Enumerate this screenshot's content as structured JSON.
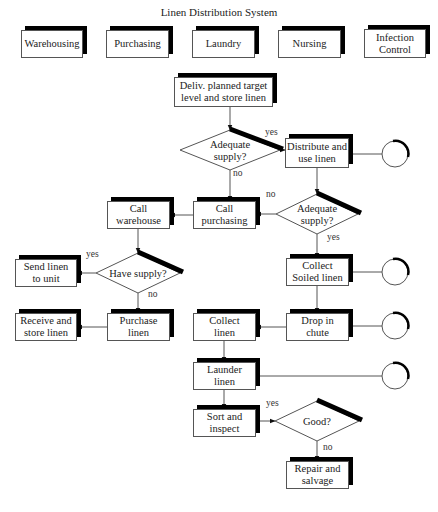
{
  "title": "Linen Distribution System",
  "colors": {
    "stroke": "#555555",
    "shadow": "#000000",
    "text": "#222222"
  },
  "departments": [
    {
      "id": "warehousing",
      "label": "Warehousing",
      "x": 21,
      "y": 30,
      "w": 62,
      "h": 28
    },
    {
      "id": "purchasing",
      "label": "Purchasing",
      "x": 106,
      "y": 30,
      "w": 63,
      "h": 28
    },
    {
      "id": "laundry",
      "label": "Laundry",
      "x": 192,
      "y": 30,
      "w": 63,
      "h": 28
    },
    {
      "id": "nursing",
      "label": "Nursing",
      "x": 278,
      "y": 30,
      "w": 63,
      "h": 28
    },
    {
      "id": "infection-control",
      "label": "Infection\nControl",
      "x": 364,
      "y": 29,
      "w": 62,
      "h": 29
    }
  ],
  "process_boxes": [
    {
      "id": "deliv-target",
      "label": "Deliv. planned target\nlevel and store linen",
      "x": 174,
      "y": 77,
      "w": 99,
      "h": 30
    },
    {
      "id": "distribute-use",
      "label": "Distribute and\nuse linen",
      "x": 285,
      "y": 138,
      "w": 64,
      "h": 30
    },
    {
      "id": "call-purchasing",
      "label": "Call\npurchasing",
      "x": 193,
      "y": 201,
      "w": 63,
      "h": 28
    },
    {
      "id": "call-warehouse",
      "label": "Call\nwarehouse",
      "x": 107,
      "y": 201,
      "w": 63,
      "h": 28
    },
    {
      "id": "send-linen",
      "label": "Send linen\nto unit",
      "x": 15,
      "y": 259,
      "w": 62,
      "h": 28
    },
    {
      "id": "collect-soiled",
      "label": "Collect\nSoiled linen",
      "x": 286,
      "y": 258,
      "w": 63,
      "h": 28
    },
    {
      "id": "receive-store",
      "label": "Receive and\nstore linen",
      "x": 15,
      "y": 313,
      "w": 62,
      "h": 28
    },
    {
      "id": "purchase-linen",
      "label": "Purchase\nlinen",
      "x": 107,
      "y": 313,
      "w": 63,
      "h": 28
    },
    {
      "id": "collect-linen",
      "label": "Collect\nlinen",
      "x": 193,
      "y": 313,
      "w": 63,
      "h": 28
    },
    {
      "id": "drop-chute",
      "label": "Drop in\nchute",
      "x": 286,
      "y": 313,
      "w": 63,
      "h": 28
    },
    {
      "id": "launder-linen",
      "label": "Launder\nlinen",
      "x": 193,
      "y": 362,
      "w": 63,
      "h": 28
    },
    {
      "id": "sort-inspect",
      "label": "Sort and\ninspect",
      "x": 193,
      "y": 409,
      "w": 63,
      "h": 28
    },
    {
      "id": "repair-salvage",
      "label": "Repair and\nsalvage",
      "x": 286,
      "y": 461,
      "w": 63,
      "h": 28
    }
  ],
  "decisions": [
    {
      "id": "adequate-supply-1",
      "label": "Adequate\nsupply?",
      "cx": 230,
      "cy": 150,
      "hw": 50,
      "hh": 20
    },
    {
      "id": "adequate-supply-2",
      "label": "Adequate\nsupply?",
      "cx": 317,
      "cy": 214,
      "hw": 41,
      "hh": 20
    },
    {
      "id": "have-supply",
      "label": "Have supply?",
      "cx": 138,
      "cy": 273,
      "hw": 42,
      "hh": 20
    },
    {
      "id": "good",
      "label": "Good?",
      "cx": 317,
      "cy": 421,
      "hw": 42,
      "hh": 20
    }
  ],
  "terminals": [
    {
      "id": "terminal-1",
      "cx": 395,
      "cy": 154,
      "r": 13
    },
    {
      "id": "terminal-2",
      "cx": 395,
      "cy": 272,
      "r": 13
    },
    {
      "id": "terminal-3",
      "cx": 395,
      "cy": 326,
      "r": 13
    },
    {
      "id": "terminal-4",
      "cx": 395,
      "cy": 376,
      "r": 13
    }
  ],
  "flow_labels": [
    {
      "text": "yes",
      "x": 265,
      "y": 134
    },
    {
      "text": "no",
      "x": 233,
      "y": 175
    },
    {
      "text": "no",
      "x": 266,
      "y": 196
    },
    {
      "text": "yes",
      "x": 327,
      "y": 239
    },
    {
      "text": "yes",
      "x": 86,
      "y": 256
    },
    {
      "text": "no",
      "x": 148,
      "y": 296
    },
    {
      "text": "yes",
      "x": 266,
      "y": 405
    },
    {
      "text": "no",
      "x": 323,
      "y": 449
    }
  ],
  "connectors": [
    {
      "from": "deliv-target",
      "to": "adequate-supply-1",
      "points": [
        [
          230,
          107
        ],
        [
          230,
          130
        ]
      ],
      "arrow": true
    },
    {
      "from": "adequate-supply-1",
      "to": "distribute-use",
      "points": [
        [
          280,
          150
        ],
        [
          285,
          150
        ]
      ],
      "arrow": true
    },
    {
      "from": "adequate-supply-1",
      "to": "call-purchasing",
      "points": [
        [
          230,
          170
        ],
        [
          230,
          201
        ]
      ],
      "arrow": true
    },
    {
      "from": "distribute-use",
      "to": "terminal-1",
      "points": [
        [
          349,
          154
        ],
        [
          382,
          154
        ]
      ],
      "arrow": false
    },
    {
      "from": "distribute-use",
      "to": "adequate-supply-2",
      "points": [
        [
          317,
          168
        ],
        [
          317,
          194
        ]
      ],
      "arrow": true
    },
    {
      "from": "adequate-supply-2",
      "to": "call-purchasing",
      "points": [
        [
          276,
          214
        ],
        [
          256,
          214
        ]
      ],
      "arrow": true
    },
    {
      "from": "call-purchasing",
      "to": "call-warehouse",
      "points": [
        [
          193,
          215
        ],
        [
          170,
          215
        ]
      ],
      "arrow": true
    },
    {
      "from": "call-warehouse",
      "to": "have-supply",
      "points": [
        [
          138,
          229
        ],
        [
          138,
          253
        ]
      ],
      "arrow": true
    },
    {
      "from": "have-supply",
      "to": "send-linen",
      "points": [
        [
          96,
          273
        ],
        [
          77,
          273
        ]
      ],
      "arrow": true
    },
    {
      "from": "have-supply",
      "to": "purchase-linen",
      "points": [
        [
          138,
          293
        ],
        [
          138,
          313
        ]
      ],
      "arrow": true
    },
    {
      "from": "purchase-linen",
      "to": "receive-store",
      "points": [
        [
          107,
          327
        ],
        [
          77,
          327
        ]
      ],
      "arrow": true
    },
    {
      "from": "adequate-supply-2",
      "to": "collect-soiled",
      "points": [
        [
          317,
          234
        ],
        [
          317,
          258
        ]
      ],
      "arrow": true
    },
    {
      "from": "collect-soiled",
      "to": "terminal-2",
      "points": [
        [
          349,
          272
        ],
        [
          382,
          272
        ]
      ],
      "arrow": false
    },
    {
      "from": "collect-soiled",
      "to": "drop-chute",
      "points": [
        [
          317,
          286
        ],
        [
          317,
          313
        ]
      ],
      "arrow": true
    },
    {
      "from": "drop-chute",
      "to": "terminal-3",
      "points": [
        [
          349,
          326
        ],
        [
          382,
          326
        ]
      ],
      "arrow": false
    },
    {
      "from": "drop-chute",
      "to": "collect-linen",
      "points": [
        [
          286,
          327
        ],
        [
          256,
          327
        ]
      ],
      "arrow": true
    },
    {
      "from": "collect-linen",
      "to": "launder-linen",
      "points": [
        [
          224,
          341
        ],
        [
          224,
          362
        ]
      ],
      "arrow": true
    },
    {
      "from": "launder-linen",
      "to": "terminal-4",
      "points": [
        [
          256,
          376
        ],
        [
          382,
          376
        ]
      ],
      "arrow": false
    },
    {
      "from": "launder-linen",
      "to": "sort-inspect",
      "points": [
        [
          224,
          390
        ],
        [
          224,
          409
        ]
      ],
      "arrow": true
    },
    {
      "from": "sort-inspect",
      "to": "good",
      "points": [
        [
          256,
          421
        ],
        [
          275,
          421
        ]
      ],
      "arrow": true
    },
    {
      "from": "good",
      "to": "repair-salvage",
      "points": [
        [
          317,
          441
        ],
        [
          317,
          461
        ]
      ],
      "arrow": true
    }
  ]
}
